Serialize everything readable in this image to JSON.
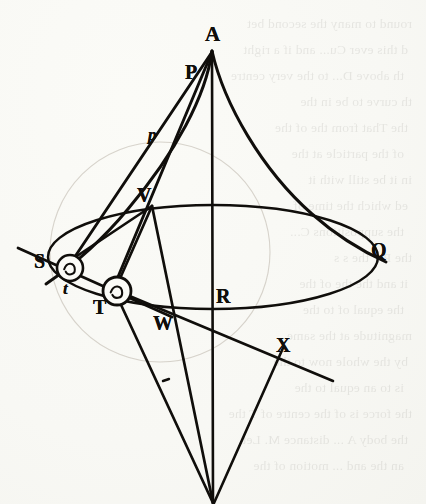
{
  "figure": {
    "kind": "geometry-diagram",
    "source_style": "engraved plate, antiquarian printed book",
    "ink_color": "#100e0b",
    "paper_color": "#fbfbf7",
    "width": 426,
    "height": 504
  },
  "labels": [
    {
      "id": "A",
      "text": "A",
      "x": 205,
      "y": 24,
      "size": 21,
      "italic": false
    },
    {
      "id": "P",
      "text": "P",
      "x": 185,
      "y": 62,
      "size": 20,
      "italic": false
    },
    {
      "id": "p",
      "text": "p",
      "x": 148,
      "y": 126,
      "size": 17,
      "italic": true
    },
    {
      "id": "V",
      "text": "V",
      "x": 137,
      "y": 185,
      "size": 20,
      "italic": false
    },
    {
      "id": "S",
      "text": "S",
      "x": 34,
      "y": 251,
      "size": 20,
      "italic": false
    },
    {
      "id": "t",
      "text": "t",
      "x": 63,
      "y": 280,
      "size": 17,
      "italic": true
    },
    {
      "id": "T",
      "text": "T",
      "x": 93,
      "y": 297,
      "size": 20,
      "italic": false
    },
    {
      "id": "W",
      "text": "W",
      "x": 153,
      "y": 313,
      "size": 20,
      "italic": false
    },
    {
      "id": "R",
      "text": "R",
      "x": 216,
      "y": 286,
      "size": 20,
      "italic": false
    },
    {
      "id": "Q",
      "text": "Q",
      "x": 371,
      "y": 240,
      "size": 20,
      "italic": false
    },
    {
      "id": "X",
      "text": "X",
      "x": 276,
      "y": 335,
      "size": 20,
      "italic": false
    }
  ],
  "points": {
    "A": {
      "x": 212,
      "y": 50
    },
    "P": {
      "x": 198,
      "y": 86
    },
    "p": {
      "x": 163,
      "y": 142
    },
    "V": {
      "x": 152,
      "y": 205
    },
    "S": {
      "x": 70,
      "y": 268
    },
    "T": {
      "x": 117,
      "y": 291
    },
    "W": {
      "x": 175,
      "y": 318
    },
    "R": {
      "x": 213,
      "y": 310
    },
    "Q": {
      "x": 378,
      "y": 257
    },
    "X": {
      "x": 295,
      "y": 356
    },
    "C": {
      "x": 213,
      "y": 503
    }
  },
  "bodies": [
    {
      "id": "body-S",
      "at": "S",
      "radius": 13,
      "glyph": "spiral-mark"
    },
    {
      "id": "body-T",
      "at": "T",
      "radius": 14,
      "glyph": "spiral-mark"
    }
  ],
  "ellipse": {
    "cx": 213,
    "cy": 257,
    "rx": 165,
    "ry": 52,
    "note": "orbit ellipse through S-side and Q"
  },
  "faint_circle": {
    "cx": 160,
    "cy": 252,
    "r": 110,
    "note": "faint construction circle, lightly inked"
  },
  "ghost_text": [
    "round to many the second bet",
    "d this ever Cu... and if a right",
    "th above D... to the very centre",
    "th curve to be in the",
    "the That from the of the",
    "of the particle at the",
    "in it be still with it",
    "ed which the time of",
    "the suppositions C...",
    "the P T the s s",
    "it and the the of the",
    "the equal of to the",
    "magnitude at the same",
    "by the whole now to the",
    "is to an equal to the",
    "the force is of the centre of T the",
    "the body A ... distance M. Let",
    "an the and ... motion of the"
  ]
}
